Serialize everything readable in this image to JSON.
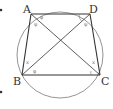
{
  "diagram": {
    "type": "cyclic-quadrilateral",
    "colors": {
      "stroke": "#333333",
      "circle": "#888888",
      "marks": "#777777"
    },
    "circle": {
      "cx": 60,
      "cy": 55,
      "r": 43
    },
    "points": {
      "A": {
        "label": "A",
        "x": 31,
        "y": 14
      },
      "D": {
        "label": "D",
        "x": 90,
        "y": 14
      },
      "B": {
        "label": "B",
        "x": 22,
        "y": 75
      },
      "C": {
        "label": "C",
        "x": 100,
        "y": 75
      }
    },
    "segments": [
      "AD",
      "BC",
      "AB",
      "DC",
      "AC",
      "BD"
    ],
    "angle_marks": {
      "phi": "φ",
      "psi": "ψ",
      "x": "x"
    }
  }
}
